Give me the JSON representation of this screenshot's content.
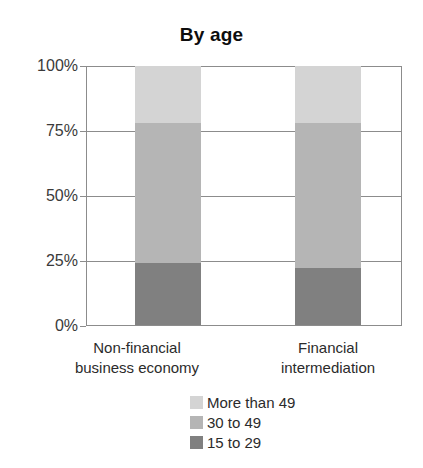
{
  "chart_data": {
    "type": "bar",
    "subtype": "stacked-percentage-column",
    "title": "By age",
    "xlabel": "",
    "ylabel": "",
    "ylim": [
      0,
      100
    ],
    "y_unit": "%",
    "grid": true,
    "legend_position": "bottom-right",
    "categories": [
      "Non-financial business economy",
      "Financial intermediation"
    ],
    "category_lines": [
      [
        "Non-financial",
        "business economy"
      ],
      [
        "Financial",
        "intermediation"
      ]
    ],
    "yticks": [
      0,
      25,
      50,
      75,
      100
    ],
    "ytick_labels": [
      "0%",
      "25%",
      "50%",
      "75%",
      "100%"
    ],
    "series": [
      {
        "name": "More than 49",
        "color": "#d4d4d4",
        "values": [
          22,
          22
        ]
      },
      {
        "name": "30 to 49",
        "color": "#b5b5b5",
        "values": [
          54,
          56
        ]
      },
      {
        "name": "15 to 29",
        "color": "#808080",
        "values": [
          24,
          22
        ]
      }
    ],
    "stack_order_bottom_to_top": [
      "15 to 29",
      "30 to 49",
      "More than 49"
    ]
  },
  "axis": {
    "ytick_0": "0%",
    "ytick_1": "25%",
    "ytick_2": "50%",
    "ytick_3": "75%",
    "ytick_4": "100%"
  },
  "xlabels": {
    "cat0_line1": "Non-financial",
    "cat0_line2": "business economy",
    "cat1_line1": "Financial",
    "cat1_line2": "intermediation"
  },
  "legend": {
    "items": [
      {
        "label": "More than 49",
        "color": "#d4d4d4"
      },
      {
        "label": "30 to 49",
        "color": "#b5b5b5"
      },
      {
        "label": "15 to 29",
        "color": "#808080"
      }
    ]
  }
}
